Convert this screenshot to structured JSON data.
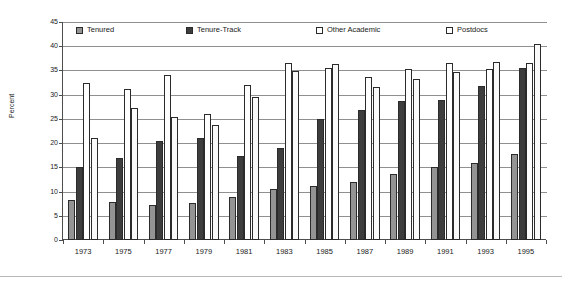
{
  "chart_data": {
    "type": "bar",
    "title": "",
    "subtitle": "",
    "xlabel": "",
    "ylabel": "Percent",
    "ylim": [
      0,
      45
    ],
    "ytick_step": 5,
    "yticks": [
      0,
      5,
      10,
      15,
      20,
      25,
      30,
      35,
      40,
      45
    ],
    "grid": true,
    "grid_axis": "y",
    "legend_position": "top-inside",
    "categories": [
      "1973",
      "1975",
      "1977",
      "1979",
      "1981",
      "1983",
      "1985",
      "1987",
      "1989",
      "1991",
      "1993",
      "1995"
    ],
    "series": [
      {
        "name": "Tenured",
        "color": "#949494",
        "values": [
          8.3,
          7.8,
          7.3,
          7.6,
          8.9,
          10.6,
          11.1,
          11.9,
          13.7,
          15.0,
          15.9,
          17.7
        ]
      },
      {
        "name": "Tenure-Track",
        "color": "#3d3d3d",
        "values": [
          15.0,
          17.0,
          20.4,
          21.1,
          17.4,
          19.0,
          25.0,
          26.8,
          28.7,
          28.8,
          31.7,
          35.5
        ]
      },
      {
        "name": "Other Academic",
        "color": "#ffffff",
        "values": [
          32.5,
          31.2,
          34.0,
          26.0,
          31.9,
          36.6,
          35.6,
          33.7,
          35.2,
          36.5,
          35.4,
          36.5
        ]
      },
      {
        "name": "Postdocs",
        "color": "#ffffff",
        "values": [
          21.0,
          27.2,
          25.4,
          23.8,
          29.6,
          34.8,
          36.4,
          31.6,
          33.3,
          34.6,
          36.8,
          40.5
        ]
      }
    ]
  },
  "legend": {
    "items": [
      {
        "label": "Tenured",
        "swatch": "legend-swatch-tenured"
      },
      {
        "label": "Tenure-Track",
        "swatch": "legend-swatch-tenure-track"
      },
      {
        "label": "Other Academic",
        "swatch": "legend-swatch-other-academic"
      },
      {
        "label": "Postdocs",
        "swatch": "legend-swatch-postdocs"
      }
    ]
  },
  "axes": {
    "y_title": "Percent",
    "y_tick_labels": [
      "0",
      "5",
      "10",
      "15",
      "20",
      "25",
      "30",
      "35",
      "40",
      "45"
    ],
    "x_tick_labels": [
      "1973",
      "1975",
      "1977",
      "1979",
      "1981",
      "1983",
      "1985",
      "1987",
      "1989",
      "1991",
      "1993",
      "1995"
    ]
  },
  "colors": {
    "series_tenured": "#949494",
    "series_tenure_track": "#3d3d3d",
    "series_other_academic": "#ffffff",
    "series_postdocs": "#ffffff",
    "grid": "#909090",
    "axis": "#4d4d4d",
    "text": "#1a1a1a",
    "background": "#ffffff"
  }
}
